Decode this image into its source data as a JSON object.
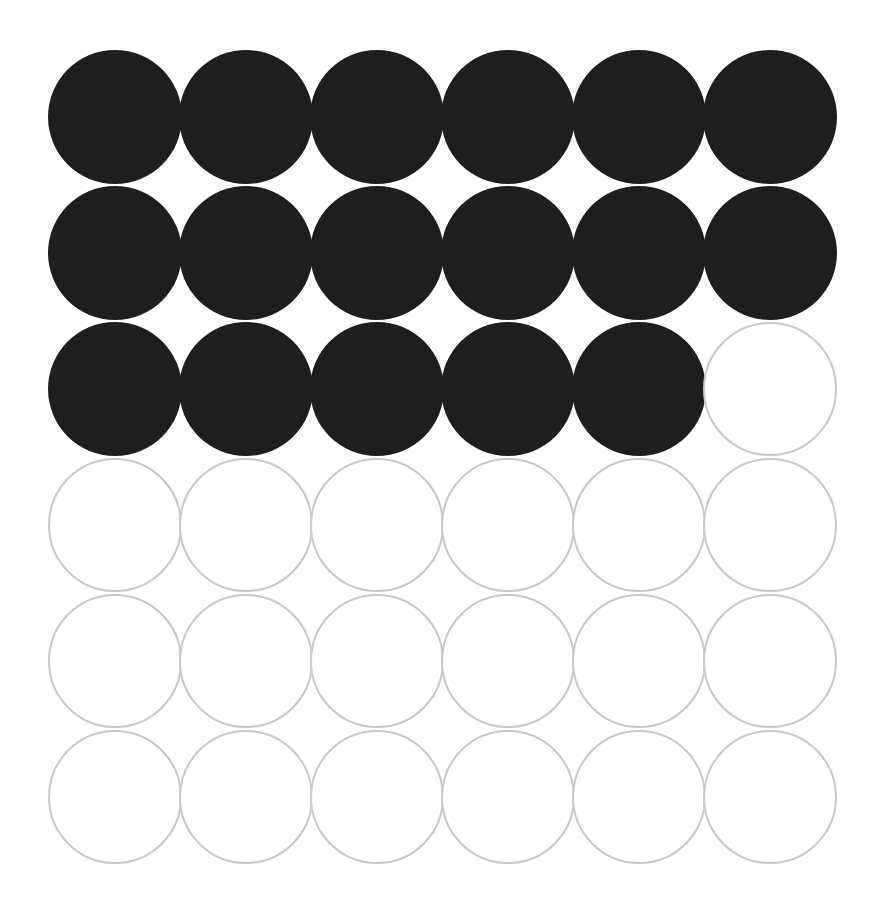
{
  "chart_data": {
    "type": "waffle",
    "title": "",
    "rows": 6,
    "cols": 6,
    "total": 36,
    "filled": 17,
    "empty": 19,
    "categories": [
      "filled",
      "empty"
    ],
    "values": [
      17,
      19
    ],
    "colors": {
      "filled": "#1e1e1e",
      "empty_stroke": "#c8c8c8",
      "background": "#ffffff"
    },
    "fill_order": "row-major, left-to-right, top-to-bottom",
    "legend": "none",
    "grid": false
  },
  "layout": {
    "origin_x": 48,
    "origin_y": 50,
    "step_x": 131,
    "step_y": 136,
    "diameter": 134
  }
}
